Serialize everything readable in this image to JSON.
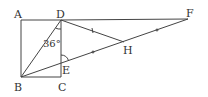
{
  "figure": {
    "type": "geometry-diagram",
    "points": {
      "A": {
        "label": "A",
        "x": 21,
        "y": 20
      },
      "D": {
        "label": "D",
        "x": 61,
        "y": 20
      },
      "F": {
        "label": "F",
        "x": 188,
        "y": 19
      },
      "B": {
        "label": "B",
        "x": 21,
        "y": 77
      },
      "C": {
        "label": "C",
        "x": 61,
        "y": 77
      },
      "E": {
        "label": "E",
        "x": 61,
        "y": 63
      },
      "H": {
        "label": "H",
        "x": 124,
        "y": 42
      }
    },
    "angle_label": "36°",
    "stroke_color": "#444444"
  }
}
